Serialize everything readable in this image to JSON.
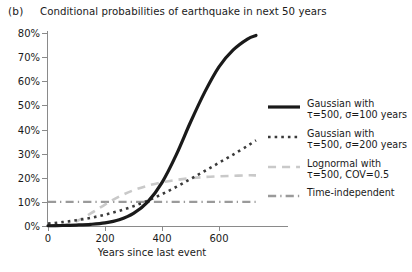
{
  "panel_label": "(b)",
  "chart_data": {
    "type": "line",
    "title": "Conditional probabilities of earthquake in next 50 years",
    "xlabel": "Years since last event",
    "ylabel": "",
    "xlim": [
      0,
      730
    ],
    "ylim": [
      0,
      80
    ],
    "grid": false,
    "legend_position": "right",
    "xticks": [
      0,
      200,
      400,
      600
    ],
    "xticklabels": [
      "0",
      "200",
      "400",
      "600"
    ],
    "yticks": [
      0,
      10,
      20,
      30,
      40,
      50,
      60,
      70,
      80
    ],
    "yticklabels": [
      "0%",
      "10%",
      "20%",
      "30%",
      "40%",
      "50%",
      "60%",
      "70%",
      "80%"
    ],
    "series": [
      {
        "name": "gaussian-sigma-100",
        "legend_line1": "Gaussian with",
        "legend_line2": "τ=500, σ=100 years",
        "style": "solid",
        "color": "#1a1a1a",
        "width": 3.2,
        "x": [
          0,
          50,
          100,
          150,
          200,
          250,
          300,
          350,
          400,
          450,
          500,
          550,
          600,
          650,
          700,
          730
        ],
        "y": [
          0.1,
          0.2,
          0.4,
          0.7,
          1.3,
          2.6,
          5.2,
          10.0,
          18.0,
          29.5,
          43.0,
          55.5,
          66.0,
          73.0,
          77.5,
          79.0
        ]
      },
      {
        "name": "gaussian-sigma-200",
        "legend_line1": "Gaussian with",
        "legend_line2": "τ=500, σ=200 years",
        "style": "dotted",
        "color": "#3a3a3a",
        "width": 2.6,
        "x": [
          0,
          50,
          100,
          150,
          200,
          250,
          300,
          350,
          400,
          450,
          500,
          550,
          600,
          650,
          700,
          730
        ],
        "y": [
          1.0,
          1.6,
          2.4,
          3.4,
          4.7,
          6.3,
          8.2,
          10.5,
          13.2,
          16.2,
          19.5,
          22.8,
          26.2,
          29.6,
          33.2,
          35.5
        ]
      },
      {
        "name": "lognormal-cov-05",
        "legend_line1": "Lognormal with",
        "legend_line2": "τ=500, COV=0.5",
        "style": "dashed",
        "color": "#c9c9c9",
        "width": 2.6,
        "x": [
          0,
          50,
          100,
          150,
          200,
          250,
          300,
          350,
          400,
          450,
          500,
          550,
          600,
          650,
          700,
          730
        ],
        "y": [
          0.0,
          0.3,
          2.0,
          5.2,
          8.9,
          12.2,
          14.8,
          16.7,
          18.1,
          19.1,
          19.8,
          20.3,
          20.6,
          20.8,
          21.0,
          21.0
        ]
      },
      {
        "name": "time-independent",
        "legend_line1": "Time-independent",
        "legend_line2": "",
        "style": "dashdot",
        "color": "#9a9a9a",
        "width": 2.4,
        "x": [
          0,
          730
        ],
        "y": [
          10.0,
          10.0
        ]
      }
    ]
  }
}
